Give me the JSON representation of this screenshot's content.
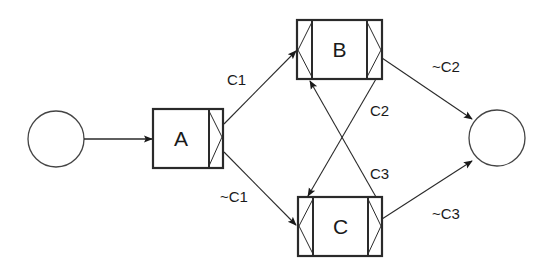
{
  "diagram": {
    "type": "petri-net-workflow",
    "colors": {
      "stroke": "#2a2a2a",
      "background": "#ffffff",
      "text": "#1a1a1a"
    },
    "nodes": {
      "start": {
        "kind": "place",
        "label": ""
      },
      "a": {
        "kind": "transition",
        "label": "A"
      },
      "b": {
        "kind": "transition",
        "label": "B"
      },
      "c": {
        "kind": "transition",
        "label": "C"
      },
      "end": {
        "kind": "place",
        "label": ""
      }
    },
    "edges": [
      {
        "from": "start",
        "to": "A",
        "label": ""
      },
      {
        "from": "A",
        "to": "B",
        "label": "C1"
      },
      {
        "from": "A",
        "to": "C",
        "label": "~C1"
      },
      {
        "from": "B",
        "to": "C",
        "label": "C2"
      },
      {
        "from": "C",
        "to": "B",
        "label": "C3"
      },
      {
        "from": "B",
        "to": "end",
        "label": "~C2"
      },
      {
        "from": "C",
        "to": "end",
        "label": "~C3"
      }
    ],
    "labels": {
      "c1": "C1",
      "not_c1": "~C1",
      "c2": "C2",
      "not_c2": "~C2",
      "c3": "C3",
      "not_c3": "~C3"
    }
  }
}
